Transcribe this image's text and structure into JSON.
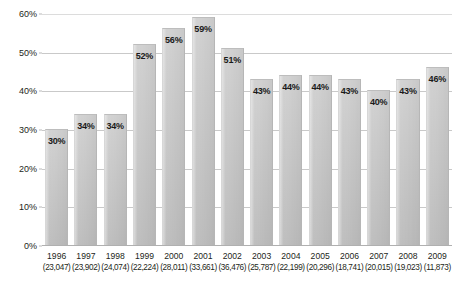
{
  "chart_data": {
    "type": "bar",
    "title": "",
    "xlabel": "",
    "ylabel": "",
    "ylim": [
      0,
      60
    ],
    "yticks": [
      "0%",
      "10%",
      "20%",
      "30%",
      "40%",
      "50%",
      "60%"
    ],
    "ytick_values": [
      0,
      10,
      20,
      30,
      40,
      50,
      60
    ],
    "grid": true,
    "legend": "none",
    "value_suffix": "%",
    "categories": [
      "1996",
      "1997",
      "1998",
      "1999",
      "2000",
      "2001",
      "2002",
      "2003",
      "2004",
      "2005",
      "2006",
      "2007",
      "2008",
      "2009"
    ],
    "category_sublabels": [
      "(23,047)",
      "(23,902)",
      "(24,074)",
      "(22,224)",
      "(28,011)",
      "(33,661)",
      "(36,476)",
      "(25,787)",
      "(22,199)",
      "(20,296)",
      "(18,741)",
      "(20,015)",
      "(19,023)",
      "(11,873)"
    ],
    "values": [
      30,
      34,
      34,
      52,
      56,
      59,
      51,
      43,
      44,
      44,
      43,
      40,
      43,
      46
    ],
    "data_labels": [
      "30%",
      "34%",
      "34%",
      "52%",
      "56%",
      "59%",
      "51%",
      "43%",
      "44%",
      "44%",
      "43%",
      "40%",
      "43%",
      "46%"
    ],
    "colors": {
      "bar_fill": "#c6c6c6",
      "gridline": "#c9c9c9",
      "baseline": "#b0b0b0",
      "label_text": "#1a1a1a",
      "axis_text": "#231f20",
      "background": "#ffffff"
    }
  },
  "title_sliver": ""
}
